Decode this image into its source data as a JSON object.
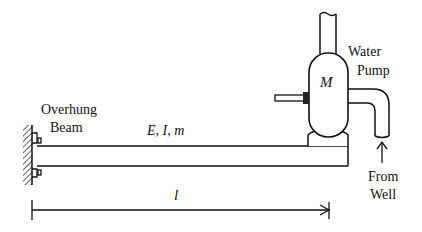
{
  "diagram": {
    "labels": {
      "overhung_line1": "Overhung",
      "overhung_line2": "Beam",
      "beam_props": "E, I, m",
      "motor": "M",
      "pump_line1": "Water",
      "pump_line2": "Pump",
      "source_line1": "From",
      "source_line2": "Well",
      "length": "l"
    }
  }
}
